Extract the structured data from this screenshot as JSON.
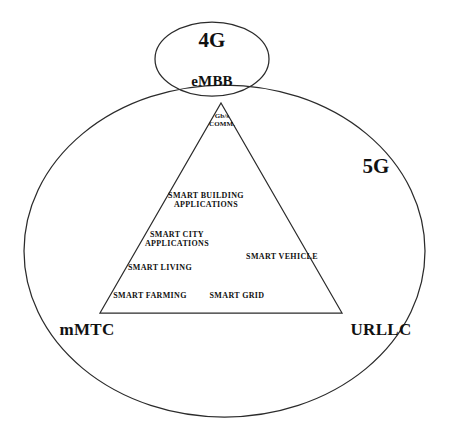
{
  "diagram": {
    "title_labels": {
      "fourg": "4G",
      "fiveg": "5G",
      "embb": "eMBB",
      "mmtc": "mMTC",
      "urllc": "URLLC"
    },
    "apex_label": "Gb/s\nCOMM.",
    "application_labels": [
      {
        "id": "smart-building-applications",
        "text": "SMART BUILDING\nAPPLICATIONS"
      },
      {
        "id": "smart-city-applications",
        "text": "SMART CITY\nAPPLICATIONS"
      },
      {
        "id": "smart-vehicle",
        "text": "SMART VEHICLE"
      },
      {
        "id": "smart-living",
        "text": "SMART LIVING"
      },
      {
        "id": "smart-farming",
        "text": "SMART FARMING"
      },
      {
        "id": "smart-grid",
        "text": "SMART GRID"
      }
    ],
    "colors": {
      "stroke": "#2b2b2b",
      "background": "#ffffff",
      "text": "#111111"
    }
  }
}
